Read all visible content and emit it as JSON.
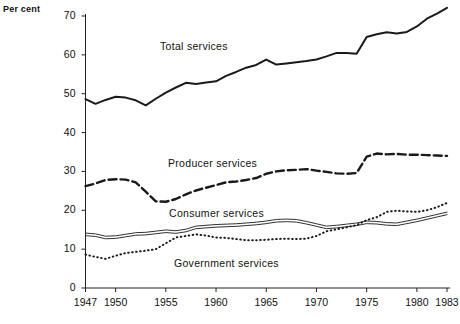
{
  "chart_data": {
    "type": "line",
    "title": "",
    "xlabel": "",
    "ylabel": "Per cent",
    "xlim": [
      1947,
      1983
    ],
    "ylim": [
      0,
      70
    ],
    "grid": false,
    "legend_position": "inline-annotations",
    "y_ticks": [
      0,
      10,
      20,
      30,
      40,
      50,
      60,
      70
    ],
    "x_ticks": [
      1947,
      1950,
      1955,
      1960,
      1965,
      1970,
      1975,
      1980,
      1983
    ],
    "x_tick_labels": [
      "1947",
      "1950",
      "1955",
      "1960",
      "1965",
      "1970",
      "1975",
      "1980",
      "1983"
    ],
    "y_tick_labels": [
      "0",
      "10",
      "20",
      "30",
      "40",
      "50",
      "60",
      "70"
    ],
    "x": [
      1947,
      1948,
      1949,
      1950,
      1951,
      1952,
      1953,
      1954,
      1955,
      1956,
      1957,
      1958,
      1959,
      1960,
      1961,
      1962,
      1963,
      1964,
      1965,
      1966,
      1967,
      1968,
      1969,
      1970,
      1971,
      1972,
      1973,
      1974,
      1975,
      1976,
      1977,
      1978,
      1979,
      1980,
      1981,
      1982,
      1983
    ],
    "series": [
      {
        "name": "Total services",
        "style": "solid",
        "color": "#1a1a1a",
        "values": [
          48.6,
          47.4,
          48.4,
          49.2,
          49.0,
          48.3,
          47.0,
          48.7,
          50.3,
          51.6,
          52.8,
          52.5,
          52.9,
          53.2,
          54.6,
          55.6,
          56.7,
          57.4,
          58.8,
          57.5,
          57.8,
          58.1,
          58.4,
          58.8,
          59.6,
          60.5,
          60.5,
          60.3,
          64.6,
          65.3,
          65.8,
          65.5,
          65.9,
          67.3,
          69.3,
          70.6,
          72.1
        ]
      },
      {
        "name": "Producer services",
        "style": "dashed",
        "color": "#1a1a1a",
        "values": [
          26.2,
          26.9,
          27.8,
          28.0,
          27.9,
          27.2,
          24.8,
          22.3,
          22.2,
          22.9,
          24.1,
          25.1,
          25.8,
          26.5,
          27.2,
          27.4,
          27.8,
          28.3,
          29.4,
          30.0,
          30.3,
          30.4,
          30.6,
          30.2,
          29.9,
          29.5,
          29.4,
          29.6,
          33.8,
          34.6,
          34.4,
          34.5,
          34.3,
          34.3,
          34.2,
          34.1,
          34.0
        ]
      },
      {
        "name": "Consumer services",
        "style": "double-solid",
        "color": "#1a1a1a",
        "values": [
          13.8,
          13.6,
          13.0,
          13.1,
          13.5,
          13.9,
          14.0,
          14.3,
          14.6,
          14.4,
          14.8,
          15.6,
          15.8,
          16.0,
          16.1,
          16.2,
          16.4,
          16.6,
          16.9,
          17.3,
          17.4,
          17.3,
          16.8,
          16.2,
          15.6,
          15.8,
          16.1,
          16.4,
          16.9,
          16.8,
          16.5,
          16.4,
          16.9,
          17.4,
          18.0,
          18.6,
          19.2
        ]
      },
      {
        "name": "Government services",
        "style": "dotted",
        "color": "#1a1a1a",
        "values": [
          8.6,
          8.0,
          7.5,
          8.3,
          9.0,
          9.3,
          9.6,
          10.0,
          11.5,
          13.0,
          13.4,
          13.8,
          13.5,
          13.0,
          12.9,
          12.6,
          12.3,
          12.3,
          12.4,
          12.6,
          12.7,
          12.6,
          12.7,
          13.4,
          14.6,
          15.1,
          15.6,
          16.2,
          17.5,
          18.2,
          19.6,
          19.9,
          19.7,
          19.6,
          20.0,
          20.8,
          21.9
        ]
      }
    ],
    "annotations": [
      {
        "text": "Total services",
        "series": "Total services"
      },
      {
        "text": "Producer services",
        "series": "Producer services"
      },
      {
        "text": "Consumer services",
        "series": "Consumer services"
      },
      {
        "text": "Government services",
        "series": "Government services"
      }
    ]
  }
}
